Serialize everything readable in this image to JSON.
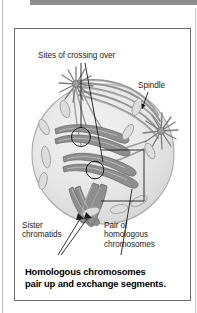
{
  "page": {
    "background_color": "#ffffff",
    "top_rule_color": "#8d8d8d",
    "border_color": "#6e6e6e"
  },
  "figure": {
    "caption": "Homologous chromosomes\npair up and exchange segments.",
    "labels": {
      "crossing_over": "Sites of crossing over",
      "spindle": "Spindle",
      "sister_chromatids": "Sister\nchromatids",
      "homologous_pair": "Pair of\nhomologous\nchromosomes"
    },
    "diagram": {
      "subject": "cell-in-meiosis-prophase-i",
      "cell_fill": "#e3e3e3",
      "cell_stroke": "#9a9a9a",
      "chromosome_fill": "#8e8e8e",
      "chromosome_stroke": "#6a6a6a",
      "spindle_fiber_color": "#8a8a8a",
      "leader_line_color": "#2a2a2a",
      "crossover_circle_color": "#2a2a2a",
      "parts": [
        "spindle-pole-top-left",
        "spindle-pole-right",
        "spindle-fibers",
        "paired-homologous-chromosomes",
        "sister-chromatids",
        "crossover-site-upper",
        "crossover-site-lower",
        "unpaired-chromosomes",
        "homologous-pair-bracket"
      ]
    }
  }
}
